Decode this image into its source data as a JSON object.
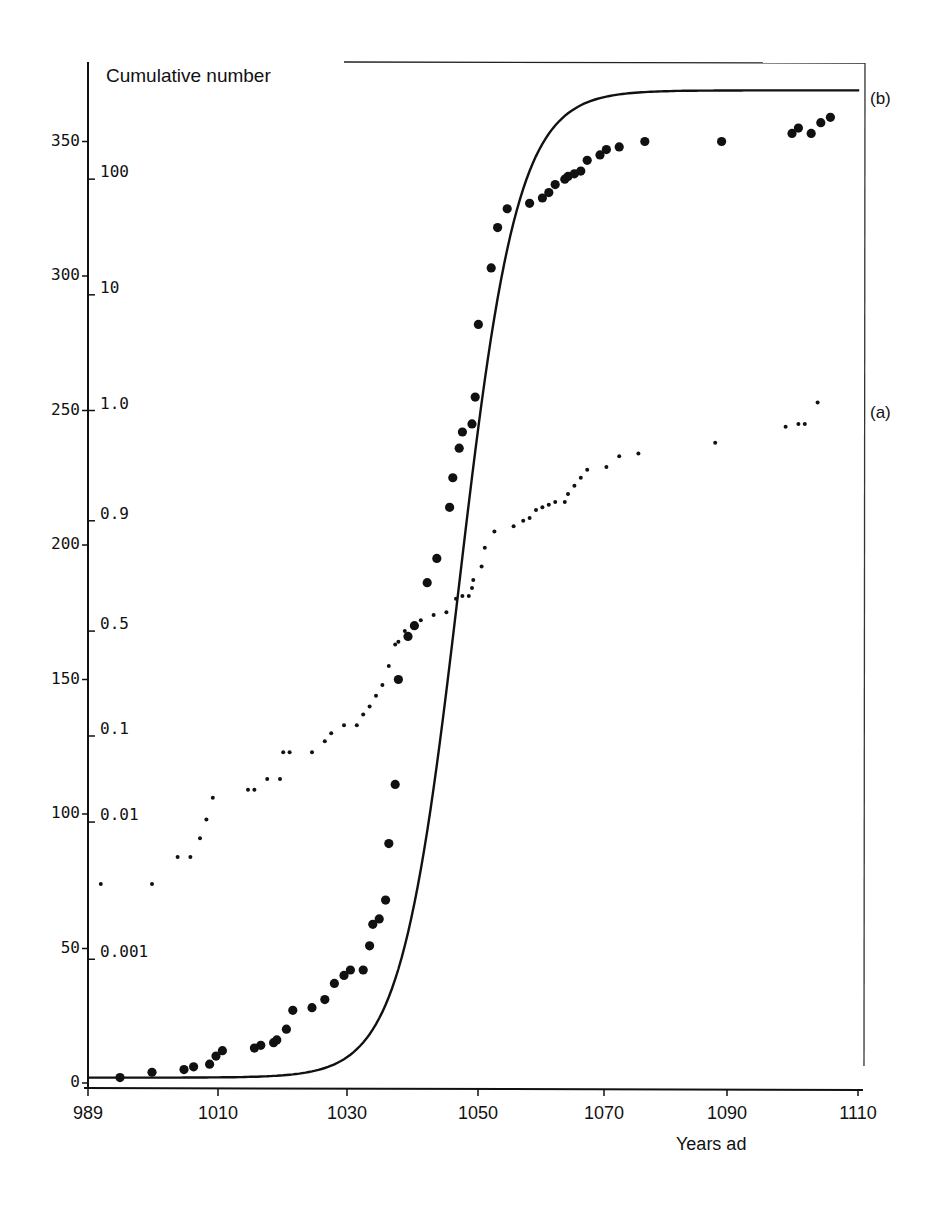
{
  "chart_data": {
    "type": "scatter",
    "title": "",
    "ylabel": "Cumulative number",
    "xlabel": "Years ad",
    "xlim": [
      989,
      1110
    ],
    "ylim": [
      0,
      370
    ],
    "grid": false,
    "x_ticks": [
      989,
      1010,
      1030,
      1050,
      1070,
      1090,
      1110
    ],
    "y_ticks_left": [
      0,
      50,
      100,
      150,
      200,
      250,
      300,
      350
    ],
    "y_ticks_probability": [
      {
        "label": "0.001",
        "at": 46
      },
      {
        "label": "0.01",
        "at": 97
      },
      {
        "label": "0.1",
        "at": 129
      },
      {
        "label": "0.5",
        "at": 168
      },
      {
        "label": "0.9",
        "at": 209
      },
      {
        "label": "1.0",
        "at": 250
      },
      {
        "label": "10",
        "at": 293
      },
      {
        "label": "100",
        "at": 336
      }
    ],
    "series": [
      {
        "name": "(b)",
        "description": "Cumulative number (large dots) with fitted logistic curve",
        "marker": "large-dot",
        "x": [
          994,
          999,
          1004,
          1005.5,
          1008,
          1009,
          1010,
          1015,
          1016,
          1018,
          1018.5,
          1020,
          1021,
          1024,
          1026,
          1027.5,
          1029,
          1030,
          1032,
          1033,
          1033.5,
          1034.5,
          1035.5,
          1036,
          1037,
          1037.5,
          1039,
          1040,
          1042,
          1043.5,
          1045.5,
          1046,
          1047,
          1047.5,
          1049,
          1049.5,
          1050,
          1052,
          1053,
          1054.5,
          1058,
          1060,
          1061,
          1062,
          1063.5,
          1064,
          1065,
          1066,
          1067,
          1069,
          1070,
          1072,
          1076,
          1088,
          1099,
          1100,
          1102,
          1103.5,
          1105
        ],
        "y": [
          2,
          4,
          5,
          6,
          7,
          10,
          12,
          13,
          14,
          15,
          16,
          20,
          27,
          28,
          31,
          37,
          40,
          42,
          42,
          51,
          59,
          61,
          68,
          89,
          111,
          150,
          166,
          170,
          186,
          195,
          214,
          225,
          236,
          242,
          245,
          255,
          282,
          303,
          318,
          325,
          327,
          329,
          331,
          334,
          336,
          337,
          338,
          339,
          343,
          345,
          347,
          348,
          350,
          350,
          353,
          355,
          353,
          357,
          359
        ],
        "fit_curve": {
          "type": "logistic",
          "asymptote": 367,
          "midpoint_year": 1047,
          "rate": 0.22
        }
      },
      {
        "name": "(a)",
        "description": "Probability scale (small dots)",
        "marker": "small-dot",
        "x": [
          991,
          999,
          1003,
          1005,
          1006.5,
          1007.5,
          1008.5,
          1014,
          1015,
          1017,
          1019,
          1019.5,
          1020.5,
          1024,
          1026,
          1027,
          1029,
          1031,
          1032,
          1033,
          1034,
          1035,
          1036,
          1037,
          1037.5,
          1038.5,
          1040,
          1041,
          1043,
          1045,
          1046.5,
          1047.5,
          1048.5,
          1049,
          1049.2,
          1050.5,
          1051,
          1052.5,
          1055.5,
          1057,
          1058,
          1059,
          1060,
          1061,
          1062,
          1063.5,
          1064,
          1065,
          1066,
          1067,
          1070,
          1072,
          1075,
          1087,
          1098,
          1100,
          1101,
          1103
        ],
        "y": [
          74,
          74,
          84,
          84,
          91,
          98,
          106,
          109,
          109,
          113,
          113,
          123,
          123,
          123,
          127,
          130,
          133,
          133,
          137,
          140,
          144,
          148,
          155,
          163,
          164,
          168,
          170,
          172,
          174,
          175,
          180,
          181,
          181,
          184,
          187,
          192,
          199,
          205,
          207,
          209,
          210,
          213,
          214,
          215,
          216,
          216,
          219,
          222,
          225,
          228,
          229,
          233,
          234,
          238,
          244,
          245,
          245,
          253
        ]
      }
    ],
    "annotations": [
      {
        "text": "(b)",
        "position": "right of curve end"
      },
      {
        "text": "(a)",
        "position": "right of small-dot series"
      }
    ]
  },
  "labels": {
    "y_title": "Cumulative number",
    "x_title": "Years ad",
    "series_b": "(b)",
    "series_a": "(a)"
  }
}
